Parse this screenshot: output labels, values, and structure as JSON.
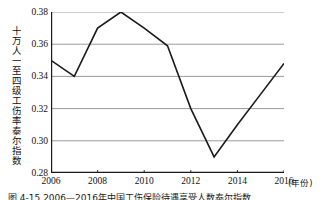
{
  "figure": {
    "caption": "图 4-15 2006—2016年中国工伤保险待遇享受人数泰尔指数",
    "x_unit_label": "(年份)",
    "y_axis_title": "十万人一至四级工伤率泰尔指数"
  },
  "colors": {
    "line": "#1a1a1a",
    "grid": "#9a9a9a",
    "axis": "#1a1a1a",
    "background": "#ffffff",
    "text": "#111111"
  },
  "chart_data": {
    "type": "line",
    "title": "",
    "xlabel": "(年份)",
    "ylabel": "十万人一至四级工伤率泰尔指数",
    "x": [
      2006,
      2007,
      2008,
      2009,
      2010,
      2011,
      2012,
      2013,
      2014,
      2015,
      2016
    ],
    "series": [
      {
        "name": "十万人一至四级工伤率泰尔指数",
        "values": [
          0.35,
          0.34,
          0.37,
          0.38,
          0.37,
          0.359,
          0.32,
          0.29,
          0.31,
          0.329,
          0.348
        ]
      }
    ],
    "xlim": [
      2006,
      2016
    ],
    "ylim": [
      0.28,
      0.38
    ],
    "xticks": [
      2006,
      2008,
      2010,
      2012,
      2014,
      2016
    ],
    "xtick_labels": [
      "2006",
      "2008",
      "2010",
      "2012",
      "2014",
      "2016"
    ],
    "yticks": [
      0.28,
      0.3,
      0.32,
      0.34,
      0.36,
      0.38
    ],
    "ytick_labels": [
      "0.28",
      "0.30",
      "0.32",
      "0.34",
      "0.36",
      "0.38"
    ],
    "grid": true,
    "grid_axis": "y",
    "legend": false,
    "legend_position": "none",
    "markers": false
  }
}
